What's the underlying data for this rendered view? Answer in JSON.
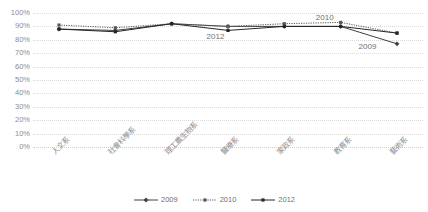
{
  "chart_data": {
    "type": "line",
    "title": "",
    "xlabel": "",
    "ylabel": "",
    "ylim": [
      0,
      100
    ],
    "grid": true,
    "legend_position": "bottom",
    "categories": [
      "人文系",
      "社會科學系",
      "理工農生物系",
      "醫療系",
      "家政系",
      "教育系",
      "藝術系"
    ],
    "ytick_labels": [
      "100%",
      "90%",
      "80%",
      "70%",
      "60%",
      "50%",
      "40%",
      "30%",
      "20%",
      "10%",
      "0%"
    ],
    "ytick_values": [
      100,
      90,
      80,
      70,
      60,
      50,
      40,
      30,
      20,
      10,
      0
    ],
    "series": [
      {
        "name": "2009",
        "style": "solid",
        "marker": "diamond",
        "color": "#404040",
        "values": [
          88,
          87,
          92,
          90,
          90,
          90,
          77
        ]
      },
      {
        "name": "2010",
        "style": "dotted",
        "marker": "square",
        "color": "#595959",
        "values": [
          91,
          89,
          92,
          90,
          92,
          93,
          85
        ]
      },
      {
        "name": "2012",
        "style": "solid",
        "marker": "square",
        "color": "#262626",
        "values": [
          88,
          86,
          92,
          87,
          90,
          90,
          85
        ]
      }
    ],
    "annotations": [
      {
        "text": "2010",
        "x_frac": 0.725,
        "y_pct": 96
      },
      {
        "text": "2012",
        "x_frac": 0.445,
        "y_pct": 82
      },
      {
        "text": "2009",
        "x_frac": 0.835,
        "y_pct": 75
      }
    ]
  },
  "legend": {
    "entries": [
      {
        "label": "2009"
      },
      {
        "label": "2010"
      },
      {
        "label": "2012"
      }
    ]
  }
}
